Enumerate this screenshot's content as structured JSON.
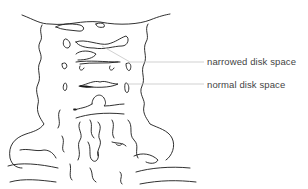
{
  "figure": {
    "annotations": [
      {
        "id": "narrowed",
        "label": "narrowed disk space"
      },
      {
        "id": "normal",
        "label": "normal disk space"
      }
    ],
    "colors": {
      "ink": "#1a1a1a",
      "leader_line": "#bdbdbd",
      "label_text": "#444444",
      "background": "#ffffff"
    }
  }
}
